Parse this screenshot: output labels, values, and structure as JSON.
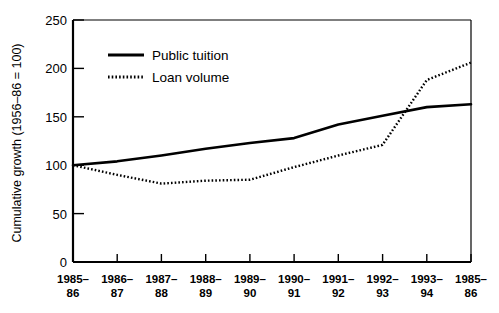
{
  "chart_data": {
    "type": "line",
    "title": "",
    "xlabel": "",
    "ylabel": "Cumulative growth (1956–86 = 100)",
    "xlim": [
      0,
      9
    ],
    "ylim": [
      0,
      250
    ],
    "ytick_values": [
      0,
      50,
      100,
      150,
      200,
      250
    ],
    "ytick_labels": [
      "0",
      "50",
      "100",
      "150",
      "200",
      "250"
    ],
    "grid": false,
    "legend_position": "upper-left-inside",
    "categories": [
      "1985–86",
      "1986–87",
      "1987–88",
      "1988–89",
      "1989–90",
      "1990–91",
      "1991–92",
      "1992–93",
      "1993–94",
      "1985–86"
    ],
    "xtick_labels_line1": [
      "1985–",
      "1986–",
      "1987–",
      "1988–",
      "1989–",
      "1990–",
      "1991–",
      "1992–",
      "1993–",
      "1985–"
    ],
    "xtick_labels_line2": [
      "86",
      "87",
      "88",
      "89",
      "90",
      "91",
      "92",
      "93",
      "94",
      "86"
    ],
    "series": [
      {
        "name": "Public tuition",
        "style": "solid",
        "color": "#000000",
        "values": [
          100,
          104,
          110,
          117,
          123,
          128,
          142,
          151,
          160,
          163
        ]
      },
      {
        "name": "Loan volume",
        "style": "dotted",
        "color": "#000000",
        "values": [
          100,
          90,
          81,
          84,
          85,
          98,
          110,
          121,
          188,
          206
        ]
      }
    ]
  },
  "legend": {
    "items": [
      {
        "label": "Public tuition",
        "style": "solid"
      },
      {
        "label": "Loan volume",
        "style": "dotted"
      }
    ]
  },
  "colors": {
    "ink": "#000000",
    "background": "#ffffff"
  }
}
